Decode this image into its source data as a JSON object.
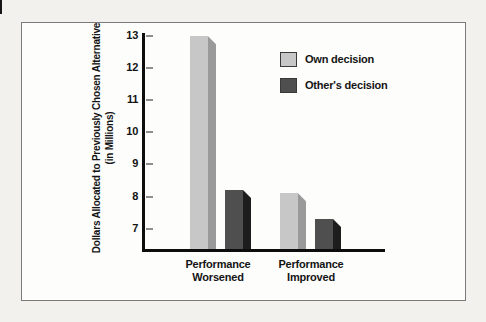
{
  "page": {
    "background": "#f2f1ee"
  },
  "figure_box": {
    "background": "#fdfdfc",
    "border_color": "#7a7a7a"
  },
  "chart_data": {
    "type": "bar",
    "title": "",
    "ylabel_lines": [
      "Dollars Allocated to Previously Chosen Alternative",
      "(in Millions)"
    ],
    "categories": [
      {
        "line1": "Performance",
        "line2": "Worsened"
      },
      {
        "line1": "Performance",
        "line2": "Improved"
      }
    ],
    "series": [
      {
        "name": "Own decision",
        "values": [
          13.0,
          8.1
        ],
        "face_color": "#c7c7c7",
        "side_color": "#9a9a9a"
      },
      {
        "name": "Other's decision",
        "values": [
          8.2,
          7.3
        ],
        "face_color": "#4f4f4f",
        "side_color": "#1d1d1d"
      }
    ],
    "yticks": [
      13,
      12,
      11,
      10,
      9,
      8,
      7
    ],
    "ylim": [
      6.3,
      13
    ],
    "grid": false,
    "legend_position": "upper right",
    "axis_color": "#0d0d0d",
    "tick_color": "#8f8f8f",
    "text_color": "#141414"
  }
}
